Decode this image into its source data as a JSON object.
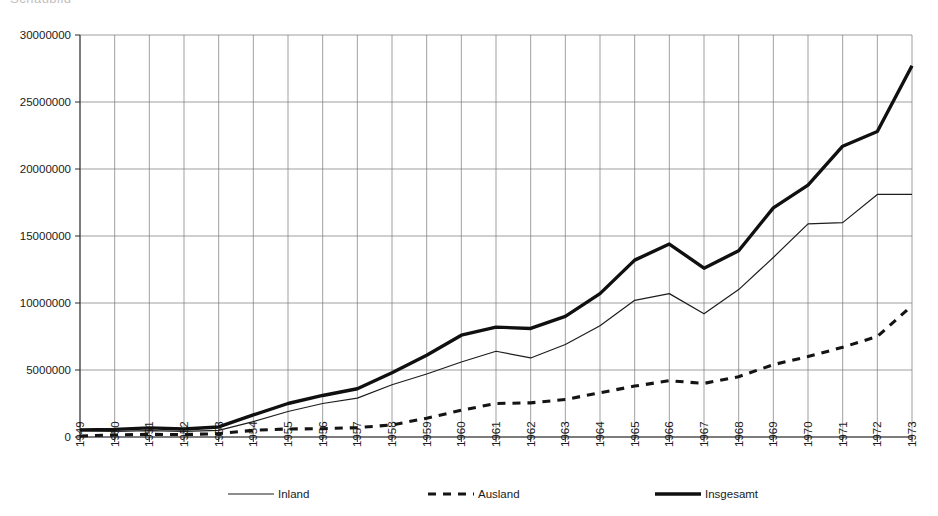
{
  "header": {
    "clipped_title_fragment": "Schaubild"
  },
  "chart_data": {
    "type": "line",
    "title": "",
    "subtitle": "",
    "xlabel": "",
    "ylabel": "",
    "grid": true,
    "legend_position": "bottom",
    "xlim": [
      1949,
      1973
    ],
    "ylim": [
      0,
      30000000
    ],
    "ytick_values": [
      0,
      5000000,
      10000000,
      15000000,
      20000000,
      25000000,
      30000000
    ],
    "ytick_labels": [
      "0",
      "5000000",
      "10000000",
      "15000000",
      "20000000",
      "25000000",
      "30000000"
    ],
    "x": [
      1949,
      1950,
      1951,
      1952,
      1953,
      1954,
      1955,
      1956,
      1957,
      1958,
      1959,
      1960,
      1961,
      1962,
      1963,
      1964,
      1965,
      1966,
      1967,
      1968,
      1969,
      1970,
      1971,
      1972,
      1973
    ],
    "xtick_labels": [
      "1949",
      "1950",
      "1951",
      "1952",
      "1953",
      "1954",
      "1955",
      "1956",
      "1957",
      "1958",
      "1959",
      "1960",
      "1961",
      "1962",
      "1963",
      "1964",
      "1965",
      "1966",
      "1967",
      "1968",
      "1969",
      "1970",
      "1971",
      "1972",
      "1973"
    ],
    "series": [
      {
        "name": "Inland",
        "style": "thin-solid",
        "color": "#1d1d1d",
        "values": [
          450000,
          420000,
          480000,
          420000,
          500000,
          1150000,
          1900000,
          2500000,
          2900000,
          3900000,
          4700000,
          5600000,
          6400000,
          5900000,
          6900000,
          8300000,
          10200000,
          10700000,
          9200000,
          11000000,
          13400000,
          15900000,
          16000000,
          18100000,
          18100000
        ]
      },
      {
        "name": "Ausland",
        "style": "dashed",
        "color": "#141414",
        "values": [
          80000,
          150000,
          200000,
          180000,
          250000,
          500000,
          600000,
          620000,
          700000,
          900000,
          1400000,
          2000000,
          2500000,
          2550000,
          2800000,
          3300000,
          3800000,
          4200000,
          4000000,
          4500000,
          5400000,
          6000000,
          6700000,
          7500000,
          9800000
        ]
      },
      {
        "name": "Insgesamt",
        "style": "thick-solid",
        "color": "#101010",
        "values": [
          530000,
          570000,
          680000,
          600000,
          750000,
          1650000,
          2500000,
          3100000,
          3600000,
          4800000,
          6100000,
          7600000,
          8200000,
          8100000,
          9000000,
          10700000,
          13200000,
          14400000,
          12600000,
          13900000,
          17100000,
          18800000,
          21700000,
          22800000,
          27700000
        ]
      }
    ]
  },
  "legend": {
    "items": [
      {
        "label": "Inland",
        "style": "thin-solid"
      },
      {
        "label": "Ausland",
        "style": "dashed"
      },
      {
        "label": "Insgesamt",
        "style": "thick-solid"
      }
    ]
  }
}
